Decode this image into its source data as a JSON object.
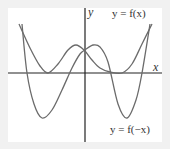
{
  "chart_data": {
    "type": "line",
    "title": "",
    "xlabel": "x",
    "ylabel": "y",
    "grid": false,
    "legend": "inline labels",
    "series": [
      {
        "name": "y = f(x)",
        "description": "even-looking quartic-like curve with two local minima touching the x-axis and a local max near the y-axis, rising steeply at both ends",
        "points_px": [
          [
            19,
            24
          ],
          [
            30,
            48
          ],
          [
            40,
            66
          ],
          [
            48,
            73
          ],
          [
            58,
            64
          ],
          [
            68,
            50
          ],
          [
            76,
            45
          ],
          [
            84,
            50
          ],
          [
            92,
            60
          ],
          [
            100,
            68
          ],
          [
            110,
            72
          ],
          [
            122,
            73
          ],
          [
            132,
            64
          ],
          [
            142,
            44
          ],
          [
            152,
            24
          ]
        ]
      },
      {
        "name": "y = f(-x)",
        "description": "mirror image of f(x) across the y-axis; crosses x-axis and dips to two deep minima",
        "points_px": [
          [
            22,
            24
          ],
          [
            27,
            73
          ],
          [
            34,
            104
          ],
          [
            42,
            118
          ],
          [
            52,
            110
          ],
          [
            62,
            90
          ],
          [
            72,
            68
          ],
          [
            80,
            54
          ],
          [
            85,
            50
          ],
          [
            93,
            45
          ],
          [
            100,
            47
          ],
          [
            108,
            62
          ],
          [
            118,
            104
          ],
          [
            127,
            118
          ],
          [
            136,
            100
          ],
          [
            142,
            73
          ],
          [
            150,
            24
          ]
        ]
      }
    ],
    "labels": {
      "fx": "y = f(x)",
      "fnegx": "y = f(−x)",
      "x_axis": "x",
      "y_axis": "y"
    },
    "colors": {
      "curve": "#6b6b6b",
      "axis": "#222222",
      "background": "#f1f1f1",
      "panel": "#ffffff"
    }
  }
}
